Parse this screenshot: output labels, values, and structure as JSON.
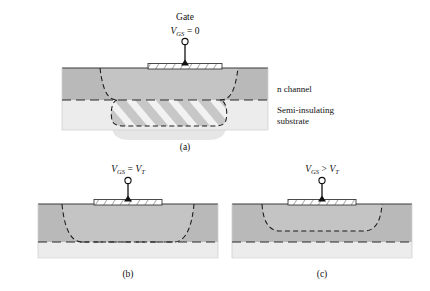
{
  "figure": {
    "title_present": false,
    "background_color": "#ffffff",
    "colors": {
      "n_channel_fill": "#b9b9b9",
      "substrate_fill": "#ececec",
      "depletion_fill": "#c9c9c9",
      "gate_fill": "#ffffff",
      "outline": "#3a3a3a",
      "dash_stroke": "#1a1a1a",
      "text": "#111111",
      "shadow": "#e2e2e2"
    }
  },
  "panels": [
    {
      "id": "a",
      "caption": "(a)",
      "gate_label": "Gate",
      "bias": {
        "var": "V",
        "sub": "GS",
        "op": "=",
        "value": "0"
      },
      "annotations": [
        {
          "name": "n-channel-label",
          "text": "n channel"
        },
        {
          "name": "substrate-label-line1",
          "text": "Semi-insulating"
        },
        {
          "name": "substrate-label-line2",
          "text": "substrate"
        }
      ],
      "depletion_state": "extends well below substrate boundary"
    },
    {
      "id": "b",
      "caption": "(b)",
      "gate_label": "",
      "bias": {
        "var": "V",
        "sub": "GS",
        "op": "=",
        "value2_var": "V",
        "value2_sub": "T"
      },
      "annotations": [],
      "depletion_state": "reaches substrate boundary (pinch-off)"
    },
    {
      "id": "c",
      "caption": "(c)",
      "gate_label": "",
      "bias": {
        "var": "V",
        "sub": "GS",
        "op": ">",
        "value2_var": "V",
        "value2_sub": "T"
      },
      "annotations": [],
      "depletion_state": "shallow depletion; channel open below"
    }
  ]
}
